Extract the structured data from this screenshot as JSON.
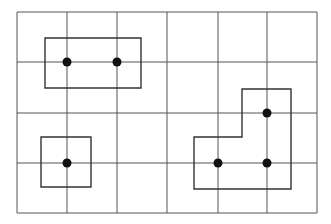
{
  "diagram": {
    "grid": {
      "x": [
        17,
        67,
        117,
        167,
        218,
        267,
        317
      ],
      "y": [
        12,
        62,
        113,
        163,
        213
      ],
      "color": "#555555"
    },
    "shapes": [
      {
        "name": "rectangle-top-left",
        "type": "polygon",
        "points": "45,38 141,38 141,88 45,88"
      },
      {
        "name": "square-bottom-left",
        "type": "polygon",
        "points": "41,137 91,137 91,187 41,187"
      },
      {
        "name": "l-shape-bottom-right",
        "type": "polygon",
        "points": "242,89 291,89 291,189 194,189 194,137 242,137"
      }
    ],
    "dots": [
      {
        "x": 67,
        "y": 62
      },
      {
        "x": 117,
        "y": 62
      },
      {
        "x": 67,
        "y": 163
      },
      {
        "x": 267,
        "y": 113
      },
      {
        "x": 218,
        "y": 163
      },
      {
        "x": 267,
        "y": 163
      }
    ],
    "dot_color": "#111111",
    "shape_color": "#333333"
  }
}
